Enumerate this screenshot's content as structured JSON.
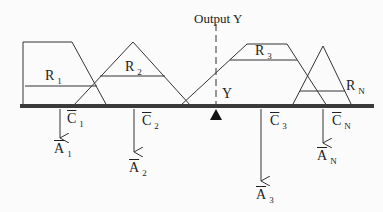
{
  "diagram": {
    "title": "Output Y",
    "output_marker_label": "Y",
    "colors": {
      "line": "#333333",
      "beam": "#3a3a3a",
      "fulcrum": "#111111",
      "background": "#fbfbfb"
    },
    "regions": [
      {
        "id": "R1",
        "label": "R",
        "subscript": "1",
        "shape": "trapezoid"
      },
      {
        "id": "R2",
        "label": "R",
        "subscript": "2",
        "shape": "triangle"
      },
      {
        "id": "R3",
        "label": "R",
        "subscript": "3",
        "shape": "trapezoid"
      },
      {
        "id": "RN",
        "label": "R",
        "subscript": "N",
        "shape": "triangle"
      }
    ],
    "forces": [
      {
        "centroid": "C",
        "centroid_sub": "1",
        "area": "A",
        "area_sub": "1"
      },
      {
        "centroid": "C",
        "centroid_sub": "2",
        "area": "A",
        "area_sub": "2"
      },
      {
        "centroid": "C",
        "centroid_sub": "3",
        "area": "A",
        "area_sub": "3"
      },
      {
        "centroid": "C",
        "centroid_sub": "N",
        "area": "A",
        "area_sub": "N"
      }
    ]
  }
}
